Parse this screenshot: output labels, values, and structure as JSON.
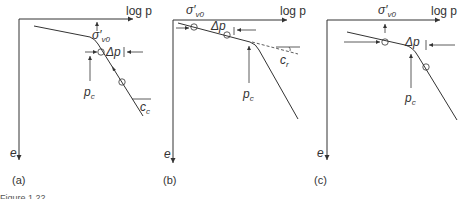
{
  "figure": {
    "caption_fragment": "Figure 1.22",
    "panels": [
      {
        "id": "a",
        "label": "(a)",
        "x_axis_label": "log p",
        "y_axis_label": "e",
        "sigma_label": "σ′",
        "sigma_sub": "v0",
        "delta_label": "Δp",
        "pc_label": "p",
        "pc_sub": "c",
        "slope_label": "c",
        "slope_sub": "c"
      },
      {
        "id": "b",
        "label": "(b)",
        "x_axis_label": "log p",
        "y_axis_label": "e",
        "sigma_label": "σ′",
        "sigma_sub": "v0",
        "delta_label": "Δp",
        "pc_label": "p",
        "pc_sub": "c",
        "slope_label": "c",
        "slope_sub": "r"
      },
      {
        "id": "c",
        "label": "(c)",
        "x_axis_label": "log p",
        "y_axis_label": "e",
        "sigma_label": "σ′",
        "sigma_sub": "v0",
        "delta_label": "Δp",
        "pc_label": "p",
        "pc_sub": "c"
      }
    ],
    "colors": {
      "line": "#333333",
      "background": "#ffffff"
    }
  }
}
